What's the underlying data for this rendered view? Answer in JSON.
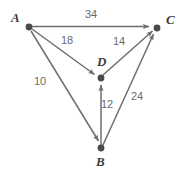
{
  "figure": {
    "type": "directed-weighted-graph",
    "background_color": "#ffffff",
    "node_color": "#4a4a4a",
    "edge_color": "#6e6e6e",
    "node_label_color": "#3b3b3b",
    "edge_label_color": "#6a6a6a"
  },
  "nodes": [
    {
      "id": "A",
      "label": "A",
      "x": 29,
      "y": 27,
      "label_x": 11,
      "label_y": 11
    },
    {
      "id": "C",
      "label": "C",
      "x": 157,
      "y": 28,
      "label_x": 166,
      "label_y": 13
    },
    {
      "id": "D",
      "label": "D",
      "x": 101,
      "y": 78,
      "label_x": 97,
      "label_y": 55
    },
    {
      "id": "B",
      "label": "B",
      "x": 101,
      "y": 148,
      "label_x": 96,
      "label_y": 155
    }
  ],
  "edges": [
    {
      "id": "A-C",
      "from": "A",
      "to": "C",
      "weight": "34",
      "label_x": 85,
      "label_y": 9
    },
    {
      "id": "A-D",
      "from": "A",
      "to": "D",
      "weight": "18",
      "label_x": 61,
      "label_y": 35
    },
    {
      "id": "A-B",
      "from": "A",
      "to": "B",
      "weight": "10",
      "label_x": 34,
      "label_y": 76
    },
    {
      "id": "D-C",
      "from": "D",
      "to": "C",
      "weight": "14",
      "label_x": 113,
      "label_y": 36
    },
    {
      "id": "B-D",
      "from": "B",
      "to": "D",
      "weight": "12",
      "label_x": 101,
      "label_y": 99
    },
    {
      "id": "B-C",
      "from": "B",
      "to": "C",
      "weight": "24",
      "label_x": 131,
      "label_y": 91
    }
  ]
}
